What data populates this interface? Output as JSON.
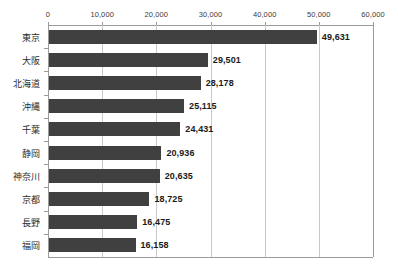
{
  "chart_data": {
    "type": "bar",
    "orientation": "horizontal",
    "title": "",
    "subtitle": "",
    "xlabel": "",
    "ylabel": "",
    "xlim": [
      0,
      60000
    ],
    "xticks": [
      0,
      10000,
      20000,
      30000,
      40000,
      50000,
      60000
    ],
    "xtick_labels": [
      "0",
      "10,000",
      "20,000",
      "30,000",
      "40,000",
      "50,000",
      "60,000"
    ],
    "grid": true,
    "grid_axis": "x",
    "legend": false,
    "legend_position": "none",
    "axis_position": "top",
    "categories": [
      "東京",
      "大阪",
      "北海道",
      "沖縄",
      "千葉",
      "静岡",
      "神奈川",
      "京都",
      "長野",
      "福岡"
    ],
    "values": [
      49631,
      29501,
      28178,
      25115,
      24431,
      20936,
      20635,
      18725,
      16475,
      16158
    ],
    "data_labels": [
      "49,631",
      "29,501",
      "28,178",
      "25,115",
      "24,431",
      "20,936",
      "20,635",
      "18,725",
      "16,475",
      "16,158"
    ],
    "series": [
      {
        "name": "",
        "values": [
          49631,
          29501,
          28178,
          25115,
          24431,
          20936,
          20635,
          18725,
          16475,
          16158
        ]
      }
    ]
  },
  "style": {
    "bar_color": "#404040",
    "grid_color": "#c9c9c9",
    "axis_color": "#9a9a9a",
    "label_color": "#2b2b2b",
    "value_color": "#1a1a1a",
    "background": "#ffffff"
  }
}
